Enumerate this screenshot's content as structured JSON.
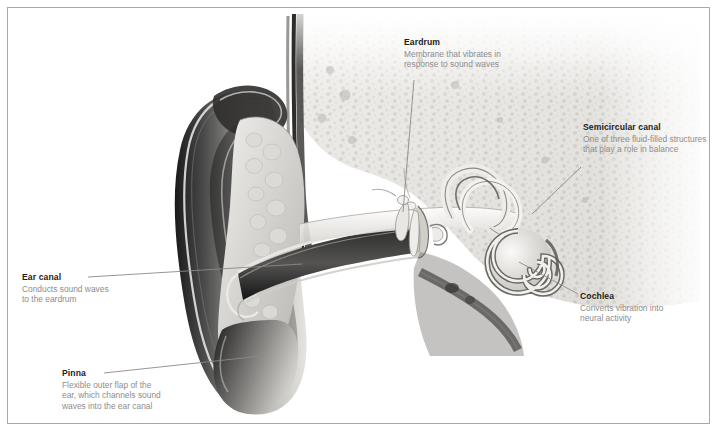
{
  "figure": {
    "type": "anatomical-diagram",
    "style": "grayscale medical illustration",
    "border_color": "#a8a8a8",
    "background_color": "#ffffff",
    "title_color": "#1d1d1b",
    "description_color": "#8d8d8d",
    "leader_line_color": "#8a8a8a"
  },
  "labels": {
    "eardrum": {
      "title": "Eardrum",
      "lines": [
        "Membrane that vibrates in",
        "response to sound waves"
      ]
    },
    "semicircular_canal": {
      "title": "Semicircular canal",
      "lines": [
        "One of three fluid-filled structures",
        "that play a role in balance"
      ]
    },
    "cochlea": {
      "title": "Cochlea",
      "lines": [
        "Converts vibration into",
        "neural activity"
      ]
    },
    "ear_canal": {
      "title": "Ear canal",
      "lines": [
        "Conducts sound waves",
        "to the eardrum"
      ]
    },
    "pinna": {
      "title": "Pinna",
      "lines": [
        "Flexible outer flap of the",
        "ear, which channels sound",
        "waves into the ear canal"
      ]
    }
  }
}
